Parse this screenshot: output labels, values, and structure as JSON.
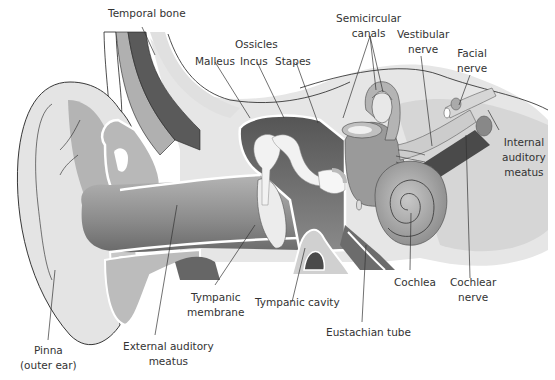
{
  "diagram": {
    "colors": {
      "light_gray": "#e6e6e6",
      "mid_gray": "#a8a8a8",
      "dark_gray": "#5c5c5c",
      "outline": "#222222",
      "label_text": "#333333"
    },
    "labels": {
      "temporal_bone": "Temporal bone",
      "ossicles": "Ossicles",
      "malleus": "Malleus",
      "incus": "Incus",
      "stapes": "Stapes",
      "semicircular_canals": [
        "Semicircular",
        "canals"
      ],
      "vestibular_nerve": [
        "Vestibular",
        "nerve"
      ],
      "facial_nerve": [
        "Facial",
        "nerve"
      ],
      "internal_auditory_meatus": [
        "Internal",
        "auditory",
        "meatus"
      ],
      "cochlea": "Cochlea",
      "cochlear_nerve": [
        "Cochlear",
        "nerve"
      ],
      "eustachian_tube": "Eustachian tube",
      "tympanic_cavity": "Tympanic cavity",
      "tympanic_membrane": [
        "Tympanic",
        "membrane"
      ],
      "external_auditory_meatus": [
        "External auditory",
        "meatus"
      ],
      "pinna": [
        "Pinna",
        "(outer ear)"
      ]
    }
  }
}
